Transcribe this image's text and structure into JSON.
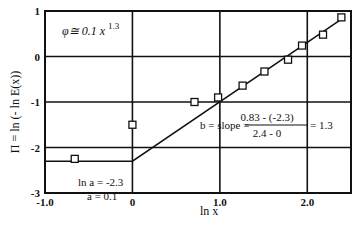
{
  "chart_data": {
    "type": "scatter",
    "title": "",
    "xlabel": "ln x",
    "ylabel": "Π = ln (- ln E(x))",
    "xlim": [
      -1.0,
      2.5
    ],
    "ylim": [
      -3,
      1
    ],
    "grid": true,
    "x_ticks": [
      {
        "value": -1.0,
        "label": "-1.0"
      },
      {
        "value": 0,
        "label": "0"
      },
      {
        "value": 1.0,
        "label": "1.0"
      },
      {
        "value": 2.0,
        "label": "2.0"
      }
    ],
    "y_ticks": [
      {
        "value": 1,
        "label": "1"
      },
      {
        "value": 0,
        "label": "0"
      },
      {
        "value": -1,
        "label": "-1"
      },
      {
        "value": -2,
        "label": "-2"
      },
      {
        "value": -3,
        "label": "-3"
      }
    ],
    "series": [
      {
        "name": "data",
        "marker": "open-square",
        "points": [
          {
            "x": -0.66,
            "y": -2.25
          },
          {
            "x": 0.0,
            "y": -1.5
          },
          {
            "x": 0.71,
            "y": -1.0
          },
          {
            "x": 0.98,
            "y": -0.9
          },
          {
            "x": 1.26,
            "y": -0.64
          },
          {
            "x": 1.51,
            "y": -0.33
          },
          {
            "x": 1.78,
            "y": -0.07
          },
          {
            "x": 1.94,
            "y": 0.24
          },
          {
            "x": 2.18,
            "y": 0.48
          },
          {
            "x": 2.39,
            "y": 0.86
          }
        ]
      },
      {
        "name": "fit",
        "style": "line",
        "points": [
          {
            "x": -1.0,
            "y": -2.3
          },
          {
            "x": 0.0,
            "y": -2.3
          },
          {
            "x": 2.4,
            "y": 0.83
          }
        ]
      }
    ],
    "annotations": [
      {
        "id": "equation",
        "text_main": "φ≅ 0.1 x",
        "text_sup": "1.3",
        "x": -0.75,
        "y": 0.65
      },
      {
        "id": "intercept_1",
        "text": "ln a = -2.3",
        "x": -0.35,
        "y": -2.62
      },
      {
        "id": "intercept_2",
        "text": "a = 0.1",
        "x": -0.35,
        "y": -2.88
      },
      {
        "id": "slope_label",
        "text": "b = slope =",
        "x": 0.45,
        "y": -1.55
      },
      {
        "id": "slope_num",
        "text": "0.83 - (-2.3)",
        "x": 1.75,
        "y": -1.38
      },
      {
        "id": "slope_den",
        "text": "2.4 - 0",
        "x": 1.75,
        "y": -1.78
      },
      {
        "id": "slope_result",
        "text": "= 1.3",
        "x": 2.3,
        "y": -1.55
      }
    ]
  },
  "colors": {
    "ink": "#111111",
    "background": "#ffffff"
  }
}
